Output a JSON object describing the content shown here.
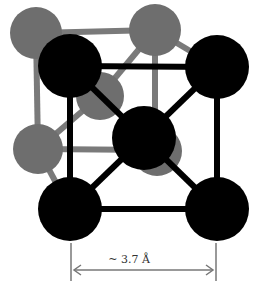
{
  "diagram": {
    "dimension_label": "~ 3.7 Å",
    "colors": {
      "front_atom": "#000000",
      "back_atom": "#6e6e6e",
      "front_bond": "#000000",
      "back_bond": "#7a7a7a",
      "arrow": "#777777"
    },
    "atoms": {
      "back": [
        {
          "id": "back-top-left",
          "cx": 36,
          "cy": 33,
          "r": 26
        },
        {
          "id": "back-top-right",
          "cx": 155,
          "cy": 30,
          "r": 26
        },
        {
          "id": "back-bottom-left",
          "cx": 38,
          "cy": 149,
          "r": 25
        },
        {
          "id": "back-center",
          "cx": 100,
          "cy": 96,
          "r": 24
        },
        {
          "id": "back-bottom-right",
          "cx": 155,
          "cy": 150,
          "r": 25
        }
      ],
      "front": [
        {
          "id": "front-top-left",
          "cx": 70,
          "cy": 66,
          "r": 32
        },
        {
          "id": "front-top-right",
          "cx": 217,
          "cy": 67,
          "r": 32
        },
        {
          "id": "body-center",
          "cx": 144,
          "cy": 138,
          "r": 32
        },
        {
          "id": "front-bottom-left",
          "cx": 70,
          "cy": 209,
          "r": 32
        },
        {
          "id": "front-bottom-right",
          "cx": 217,
          "cy": 209,
          "r": 32
        }
      ]
    }
  }
}
